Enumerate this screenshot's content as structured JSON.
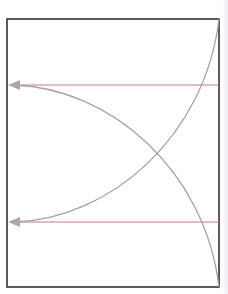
{
  "diagram": {
    "frame": {
      "x": 7,
      "y": 19,
      "width": 212,
      "height": 268,
      "stroke": "#333333"
    },
    "colors": {
      "horizontal_line": "#c9797a",
      "curve": "#a3a3a3",
      "arrowhead": "#a8a8a8"
    },
    "horizontal_lines": [
      {
        "y": 85,
        "x_start": 219,
        "x_end": 7,
        "label": ""
      },
      {
        "y": 222,
        "x_start": 219,
        "x_end": 7,
        "label": ""
      }
    ],
    "curves": [
      {
        "name": "descending-arc",
        "from": [
          10,
          85
        ],
        "to": [
          219,
          287
        ]
      },
      {
        "name": "ascending-arc",
        "from": [
          10,
          222
        ],
        "to": [
          219,
          19
        ]
      }
    ],
    "arrows": [
      {
        "name": "upper-arrow",
        "tip": [
          7,
          85
        ],
        "direction": "left"
      },
      {
        "name": "lower-arrow",
        "tip": [
          7,
          222
        ],
        "direction": "left"
      }
    ]
  }
}
